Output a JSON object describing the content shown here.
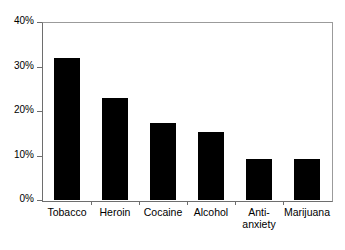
{
  "chart_data": {
    "type": "bar",
    "title": "",
    "subtitle": "",
    "xlabel": "",
    "ylabel": "",
    "categories": [
      "Tobacco",
      "Heroin",
      "Cocaine",
      "Alcohol",
      "Anti-\nanxiety",
      "Marijuana"
    ],
    "category_labels_flat": [
      "Tobacco",
      "Heroin",
      "Cocaine",
      "Alcohol",
      "Anti-anxiety",
      "Marijuana"
    ],
    "values": [
      32.0,
      23.0,
      17.3,
      15.3,
      9.3,
      9.3
    ],
    "value_labels": [
      "32%",
      "23%",
      "17.3%",
      "15.3%",
      "9.3%",
      "9.3%"
    ],
    "ylim": [
      0,
      40
    ],
    "ytick_values": [
      0,
      10,
      20,
      30,
      40
    ],
    "ytick_labels": [
      "0%",
      "10%",
      "20%",
      "30%",
      "40%"
    ],
    "grid": false,
    "legend": false,
    "legend_position": "none",
    "bar_color": "#000000",
    "axis_color": "#6e6e6e",
    "frame_color": "#9b9b9b",
    "background_color": "#ffffff"
  }
}
